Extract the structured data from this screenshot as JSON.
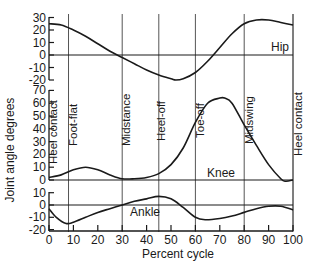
{
  "chart_data": {
    "type": "line",
    "title": "",
    "xlabel": "Percent cycle",
    "ylabel": "Joint angle degrees",
    "x_ticks": [
      0,
      10,
      20,
      30,
      40,
      50,
      60,
      70,
      80,
      90,
      100
    ],
    "xlim": [
      0,
      100
    ],
    "grid": false,
    "legend": "inline labels",
    "events": [
      {
        "label": "Heel contact",
        "x": 0
      },
      {
        "label": "Foot-flat",
        "x": 8
      },
      {
        "label": "Midstance",
        "x": 30
      },
      {
        "label": "Heel-off",
        "x": 45
      },
      {
        "label": "Toe-off",
        "x": 60
      },
      {
        "label": "Midswing",
        "x": 80
      },
      {
        "label": "Heel contact",
        "x": 100
      }
    ],
    "panels": [
      {
        "name": "Hip",
        "ylim": [
          -20,
          30
        ],
        "y_ticks": [
          30,
          20,
          10,
          0,
          -10,
          -20
        ],
        "x": [
          0,
          5,
          10,
          15,
          20,
          25,
          30,
          35,
          40,
          45,
          50,
          52,
          55,
          60,
          65,
          70,
          75,
          80,
          85,
          90,
          95,
          100
        ],
        "values": [
          25,
          24,
          20,
          15,
          9,
          3,
          -2,
          -7,
          -12,
          -16,
          -19,
          -20,
          -19,
          -14,
          -5,
          6,
          17,
          25,
          28,
          28,
          26,
          24
        ]
      },
      {
        "name": "Knee",
        "ylim": [
          0,
          70
        ],
        "y_ticks": [
          70,
          60,
          50,
          40,
          30,
          20,
          10,
          0
        ],
        "x": [
          0,
          5,
          10,
          15,
          20,
          25,
          30,
          35,
          40,
          45,
          50,
          55,
          60,
          65,
          70,
          72,
          75,
          80,
          85,
          90,
          95,
          97,
          100
        ],
        "values": [
          2,
          4,
          8,
          10,
          8,
          4,
          1,
          1,
          2,
          5,
          12,
          25,
          45,
          60,
          64,
          64,
          60,
          43,
          27,
          12,
          1,
          -1,
          0
        ]
      },
      {
        "name": "Ankle",
        "ylim": [
          -20,
          10
        ],
        "y_ticks": [
          10,
          0,
          -10,
          -20
        ],
        "x": [
          0,
          3,
          7,
          10,
          15,
          20,
          25,
          30,
          35,
          40,
          45,
          50,
          55,
          60,
          64,
          70,
          75,
          80,
          85,
          90,
          95,
          100
        ],
        "values": [
          -3,
          -10,
          -15,
          -14,
          -10,
          -6,
          -3,
          0,
          3,
          5,
          7,
          5,
          -2,
          -10,
          -12,
          -11,
          -9,
          -6,
          -3,
          -1,
          -1,
          -4
        ]
      }
    ]
  },
  "labels": {
    "hip": "Hip",
    "knee": "Knee",
    "ankle": "Ankle",
    "xlabel": "Percent cycle",
    "ylabel": "Joint angle degrees",
    "ev_heel_contact": "Heel contact",
    "ev_foot_flat": "Foot-flat",
    "ev_midstance": "Midstance",
    "ev_heel_off": "Heel-off",
    "ev_toe_off": "Toe-off",
    "ev_midswing": "Midswing",
    "ev_heel_contact_end": "Heel contact"
  },
  "colors": {
    "ink": "#1a1a1a",
    "line": "#555555",
    "background": "#ffffff"
  }
}
